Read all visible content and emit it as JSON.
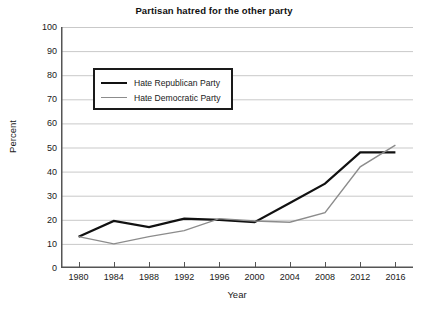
{
  "chart": {
    "title": "Partisan hatred for the other party",
    "xlabel": "Year",
    "ylabel": "Percent"
  },
  "legend": {
    "items": [
      {
        "label": "Hate Republican Party",
        "color": "#111111",
        "style": "rep"
      },
      {
        "label": "Hate Democratic Party",
        "color": "#8c8c8c",
        "style": "dem"
      }
    ]
  },
  "chart_data": {
    "type": "line",
    "title": "Partisan hatred for the other party",
    "xlabel": "Year",
    "ylabel": "Percent",
    "xlim": [
      1978,
      2018
    ],
    "ylim": [
      0,
      100
    ],
    "ytick_labels": [
      "0",
      "10",
      "20",
      "30",
      "40",
      "50",
      "60",
      "70",
      "80",
      "90",
      "100"
    ],
    "ytick_values": [
      0,
      10,
      20,
      30,
      40,
      50,
      60,
      70,
      80,
      90,
      100
    ],
    "xtick_labels": [
      "1980",
      "1984",
      "1988",
      "1992",
      "1996",
      "2000",
      "2004",
      "2008",
      "2012",
      "2016"
    ],
    "xtick_values": [
      1980,
      1984,
      1988,
      1992,
      1996,
      2000,
      2004,
      2008,
      2012,
      2016
    ],
    "grid": "horizontal",
    "legend_position": "upper-left-inside",
    "series": [
      {
        "name": "Hate Republican Party",
        "color": "#111111",
        "x": [
          1980,
          1984,
          1988,
          1992,
          1996,
          2000,
          2004,
          2008,
          2012,
          2016
        ],
        "values": [
          13,
          19.5,
          17,
          20.5,
          20,
          19,
          27,
          35,
          48,
          48
        ]
      },
      {
        "name": "Hate Democratic Party",
        "color": "#8c8c8c",
        "x": [
          1980,
          1984,
          1988,
          1992,
          1996,
          2000,
          2004,
          2008,
          2012,
          2016
        ],
        "values": [
          13,
          10,
          13,
          15.5,
          20.5,
          19.5,
          19,
          23,
          42,
          51
        ]
      }
    ]
  }
}
